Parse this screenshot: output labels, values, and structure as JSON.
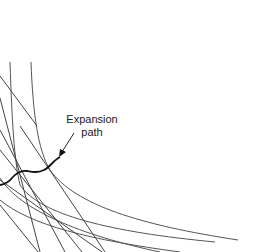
{
  "diagram": {
    "type": "isoquant-isocost",
    "annotation": {
      "line1": "Expansion",
      "line2": "path"
    },
    "colors": {
      "curve": "#333333",
      "path": "#111111",
      "text": "#222222",
      "background": "#ffffff"
    },
    "elements": {
      "isoquants": 4,
      "isocost_lines": 5,
      "expansion_path": true
    }
  }
}
